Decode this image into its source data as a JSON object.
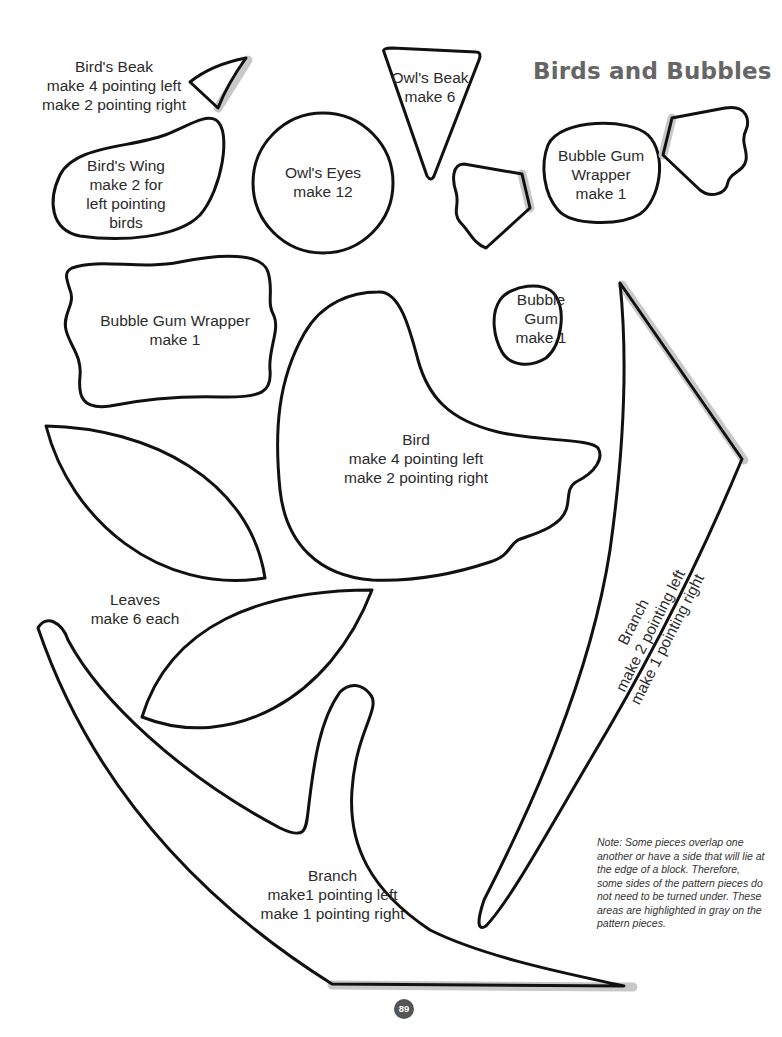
{
  "page": {
    "title": "Birds and Bubbles",
    "page_number": "89",
    "note": "Note:  Some pieces overlap one another or have a side that will lie at the edge of a block. Therefore, some sides of the pattern pieces do not need to be turned under. These areas are highlighted in gray on the pattern pieces."
  },
  "pieces": {
    "birds_beak": {
      "name": "Bird's Beak",
      "lines": [
        "make 4 pointing left",
        "make 2 pointing right"
      ]
    },
    "owls_beak": {
      "name": "Owl's Beak",
      "lines": [
        "make 6"
      ]
    },
    "birds_wing": {
      "name": "Bird's Wing",
      "lines": [
        "make 2 for",
        "left pointing",
        "birds"
      ]
    },
    "owls_eyes": {
      "name": "Owl's Eyes",
      "lines": [
        "make 12"
      ]
    },
    "bubble_gum_wrapper_small": {
      "name": "Bubble Gum",
      "name2": "Wrapper",
      "lines": [
        "make 1"
      ]
    },
    "bubble_gum_wrapper_large": {
      "name": "Bubble Gum Wrapper",
      "lines": [
        "make 1"
      ]
    },
    "bubble_gum": {
      "name": "Bubble",
      "name2": "Gum",
      "lines": [
        "make 1"
      ]
    },
    "bird": {
      "name": "Bird",
      "lines": [
        "make 4 pointing left",
        "make 2 pointing right"
      ]
    },
    "leaves": {
      "name": "Leaves",
      "lines": [
        "make 6 each"
      ]
    },
    "branch_left": {
      "name": "Branch",
      "lines": [
        "make1 pointing left",
        "make 1 pointing right"
      ]
    },
    "branch_right": {
      "name": "Branch",
      "lines": [
        "make 2 pointing left",
        "make 1 pointing right"
      ]
    }
  },
  "colors": {
    "outline": "#111111",
    "highlight_gray": "#c8c8c8",
    "title": "#666666",
    "page_badge": "#555555"
  }
}
